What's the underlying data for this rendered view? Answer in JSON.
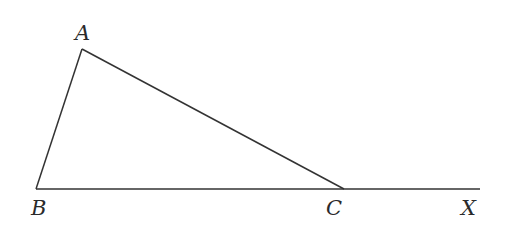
{
  "diagram": {
    "type": "triangle-with-extended-side",
    "colors": {
      "stroke": "#333333",
      "text": "#2a2a2a",
      "background": "#ffffff"
    },
    "points": [
      {
        "name": "A",
        "x": 82,
        "y": 49,
        "label_x": 75,
        "label_y": 40
      },
      {
        "name": "B",
        "x": 36,
        "y": 189,
        "label_x": 31,
        "label_y": 215
      },
      {
        "name": "C",
        "x": 344,
        "y": 189,
        "label_x": 326,
        "label_y": 215
      },
      {
        "name": "X",
        "x": 480,
        "y": 189,
        "label_x": 461,
        "label_y": 215
      }
    ],
    "segments": [
      {
        "from": "A",
        "to": "B"
      },
      {
        "from": "A",
        "to": "C"
      },
      {
        "from": "B",
        "to": "X"
      }
    ],
    "labels": {
      "a": "A",
      "b": "B",
      "c": "C",
      "x": "X"
    }
  }
}
